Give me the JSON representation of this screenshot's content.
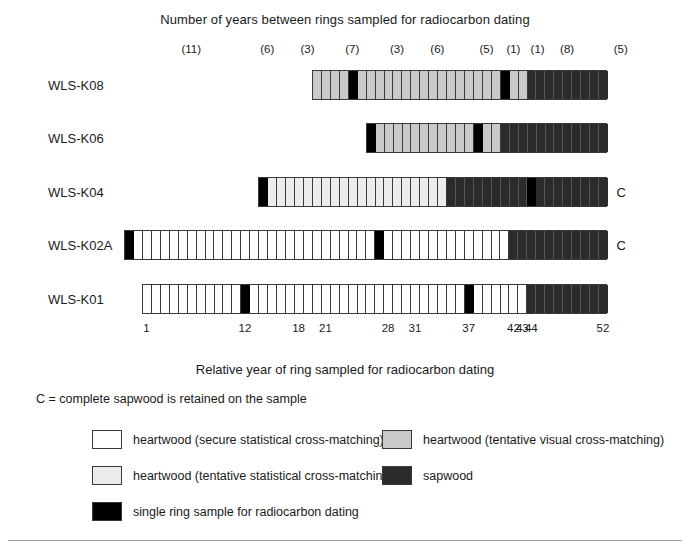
{
  "figure": {
    "top_title": "Number of years between rings sampled for radiocarbon dating",
    "bottom_title": "Relative year of ring sampled for radiocarbon dating",
    "c_note": "C = complete sapwood is retained on the sample",
    "c_marker": "C"
  },
  "chart_data": {
    "type": "bar",
    "title": "Number of years between rings sampled for radiocarbon dating",
    "xlabel": "Relative year of ring sampled for radiocarbon dating",
    "ylabel": "",
    "grid": false,
    "legend_position": "bottom",
    "axis": {
      "year_min": 1,
      "year_max": 52,
      "tick_labels": [
        "1",
        "12",
        "18",
        "21",
        "28",
        "31",
        "37",
        "42",
        "43",
        "44",
        "52"
      ],
      "tick_years": [
        1,
        12,
        18,
        21,
        28,
        31,
        37,
        42,
        43,
        44,
        52
      ]
    },
    "interval_labels": [
      {
        "text": "(11)",
        "year": 6.5
      },
      {
        "text": "(6)",
        "year": 15
      },
      {
        "text": "(3)",
        "year": 19.5
      },
      {
        "text": "(7)",
        "year": 24.5
      },
      {
        "text": "(3)",
        "year": 29.5
      },
      {
        "text": "(6)",
        "year": 34
      },
      {
        "text": "(5)",
        "year": 39.5
      },
      {
        "text": "(1)",
        "year": 42.5
      },
      {
        "text": "(1)",
        "year": 45.2
      },
      {
        "text": "(8)",
        "year": 48.5
      },
      {
        "text": "(5)",
        "year": 54.5
      }
    ],
    "categories": [
      "WLS-K08",
      "WLS-K06",
      "WLS-K04",
      "WLS-K02A",
      "WLS-K01"
    ],
    "series": [
      {
        "name": "WLS-K08",
        "label": "WLS-K08",
        "start_year": 20,
        "end_year": 52,
        "complete_sapwood": false,
        "segments": [
          {
            "type": "tent-vis",
            "years": 4
          },
          {
            "type": "sample",
            "years": 1
          },
          {
            "type": "tent-vis",
            "years": 16
          },
          {
            "type": "sample",
            "years": 1
          },
          {
            "type": "tent-vis",
            "years": 2
          },
          {
            "type": "sapwood",
            "years": 9
          }
        ]
      },
      {
        "name": "WLS-K06",
        "label": "WLS-K06",
        "start_year": 26,
        "end_year": 52,
        "complete_sapwood": false,
        "segments": [
          {
            "type": "sample",
            "years": 1
          },
          {
            "type": "tent-vis",
            "years": 11
          },
          {
            "type": "sample",
            "years": 1
          },
          {
            "type": "tent-vis",
            "years": 2
          },
          {
            "type": "sapwood",
            "years": 12
          }
        ]
      },
      {
        "name": "WLS-K04",
        "label": "WLS-K04",
        "start_year": 14,
        "end_year": 52,
        "complete_sapwood": true,
        "segments": [
          {
            "type": "sample",
            "years": 1
          },
          {
            "type": "tent-stat",
            "years": 20
          },
          {
            "type": "sapwood",
            "years": 9
          },
          {
            "type": "sample",
            "years": 1
          },
          {
            "type": "sapwood",
            "years": 8
          }
        ]
      },
      {
        "name": "WLS-K02A",
        "label": "WLS-K02A",
        "start_year": -1,
        "end_year": 52,
        "complete_sapwood": true,
        "segments": [
          {
            "type": "sample",
            "years": 1
          },
          {
            "type": "secure",
            "years": 27
          },
          {
            "type": "sample",
            "years": 1
          },
          {
            "type": "secure",
            "years": 14
          },
          {
            "type": "sapwood",
            "years": 11
          }
        ]
      },
      {
        "name": "WLS-K01",
        "label": "WLS-K01",
        "start_year": 1,
        "end_year": 52,
        "complete_sapwood": false,
        "segments": [
          {
            "type": "secure",
            "years": 11
          },
          {
            "type": "sample",
            "years": 1
          },
          {
            "type": "secure",
            "years": 24
          },
          {
            "type": "sample",
            "years": 1
          },
          {
            "type": "secure",
            "years": 6
          },
          {
            "type": "sapwood",
            "years": 9
          }
        ]
      }
    ]
  },
  "legend": {
    "items": [
      {
        "key": "secure",
        "label": "heartwood (secure statistical cross-matching)"
      },
      {
        "key": "tent-vis",
        "label": "heartwood (tentative visual cross-matching)"
      },
      {
        "key": "tent-stat",
        "label": "heartwood (tentative statistical cross-matching)"
      },
      {
        "key": "sapwood",
        "label": "sapwood"
      },
      {
        "key": "sample",
        "label": "single ring sample for radiocarbon dating"
      }
    ]
  },
  "colors": {
    "secure": "#ffffff",
    "tent_stat": "#ececec",
    "tent_vis": "#c9c9c9",
    "sapwood": "#2b2b2b",
    "sample": "#000000",
    "outline": "#3a3a3a",
    "text": "#1a1a1a"
  }
}
